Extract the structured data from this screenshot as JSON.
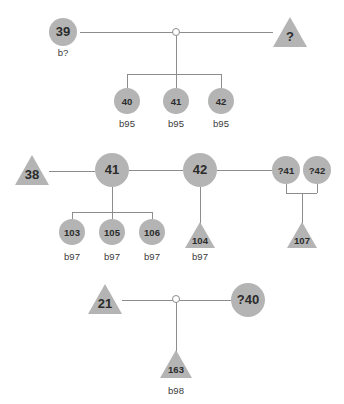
{
  "diagram": {
    "colors": {
      "shape_fill": "#b4b4b4",
      "line": "#8d8d8d",
      "text": "#2b2b2b",
      "background": "#ffffff"
    },
    "legend": {
      "circle_meaning": "female",
      "triangle_meaning": "male-or-unknown"
    }
  },
  "families": [
    {
      "name": "family-1",
      "parents": [
        {
          "id": "39",
          "shape": "circle",
          "size": "big",
          "birth": "b?",
          "cx": 63,
          "cy": 32,
          "r": 14
        },
        {
          "id": "?",
          "shape": "triangle",
          "size": "big",
          "birth": "",
          "cx": 290,
          "cy": 34,
          "r": 17
        }
      ],
      "mating": {
        "cx": 176,
        "cy": 32,
        "r": 3.5
      },
      "children": [
        {
          "id": "40",
          "shape": "circle",
          "size": "small",
          "birth": "b95",
          "cx": 127,
          "cy": 101,
          "r": 13
        },
        {
          "id": "41",
          "shape": "circle",
          "size": "small",
          "birth": "b95",
          "cx": 176,
          "cy": 101,
          "r": 13
        },
        {
          "id": "42",
          "shape": "circle",
          "size": "small",
          "birth": "b95",
          "cx": 221,
          "cy": 101,
          "r": 13
        }
      ]
    },
    {
      "name": "family-2",
      "parents": [
        {
          "id": "38",
          "shape": "triangle",
          "size": "big",
          "birth": "",
          "cx": 32,
          "cy": 172,
          "r": 17
        },
        {
          "id": "41",
          "shape": "circle",
          "size": "big",
          "birth": "",
          "cx": 112,
          "cy": 170,
          "r": 17
        },
        {
          "id": "42",
          "shape": "circle",
          "size": "big",
          "birth": "",
          "cx": 200,
          "cy": 170,
          "r": 17
        },
        {
          "id": "?41",
          "shape": "circle",
          "size": "small",
          "birth": "",
          "cx": 286,
          "cy": 170,
          "r": 14
        },
        {
          "id": "?42",
          "shape": "circle",
          "size": "small",
          "birth": "",
          "cx": 317,
          "cy": 170,
          "r": 14
        }
      ],
      "children": [
        {
          "id": "103",
          "shape": "circle",
          "size": "small",
          "birth": "b97",
          "cx": 72,
          "cy": 232,
          "r": 13
        },
        {
          "id": "105",
          "shape": "circle",
          "size": "small",
          "birth": "b97",
          "cx": 112,
          "cy": 232,
          "r": 13
        },
        {
          "id": "106",
          "shape": "circle",
          "size": "small",
          "birth": "b97",
          "cx": 152,
          "cy": 232,
          "r": 13
        },
        {
          "id": "104",
          "shape": "triangle",
          "size": "small",
          "birth": "b97",
          "cx": 200,
          "cy": 236,
          "r": 15
        },
        {
          "id": "107",
          "shape": "triangle",
          "size": "small",
          "birth": "",
          "cx": 302,
          "cy": 236,
          "r": 15
        }
      ]
    },
    {
      "name": "family-3",
      "parents": [
        {
          "id": "21",
          "shape": "triangle",
          "size": "big",
          "birth": "",
          "cx": 105,
          "cy": 301,
          "r": 17
        },
        {
          "id": "?40",
          "shape": "circle",
          "size": "big",
          "birth": "",
          "cx": 248,
          "cy": 300,
          "r": 17
        }
      ],
      "mating": {
        "cx": 176,
        "cy": 299,
        "r": 3.5
      },
      "children": [
        {
          "id": "163",
          "shape": "triangle",
          "size": "small",
          "birth": "b98",
          "cx": 176,
          "cy": 366,
          "r": 16
        }
      ]
    }
  ],
  "labels": {
    "b_unknown": "b?",
    "b95": "b95",
    "b97": "b97",
    "b98": "b98"
  }
}
